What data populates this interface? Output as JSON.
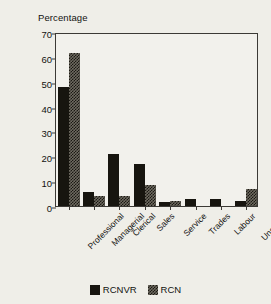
{
  "chart_data": {
    "type": "bar",
    "title": "",
    "ylabel": "Percentage",
    "xlabel": "",
    "ylim": [
      0,
      70
    ],
    "yticks": [
      0,
      10,
      20,
      30,
      40,
      50,
      60,
      70
    ],
    "grid": false,
    "legend_position": "bottom-center",
    "categories": [
      "Professional",
      "Managerial",
      "Clerical",
      "Sales",
      "Service",
      "Trades",
      "Labour",
      "Unskilled"
    ],
    "series": [
      {
        "name": "RCNVR",
        "color": "#17150f",
        "fill": "solid",
        "values": [
          48,
          5.5,
          21,
          17,
          1.5,
          3,
          3,
          2
        ]
      },
      {
        "name": "RCN",
        "color": "#6e6a60",
        "fill": "hatched",
        "values": [
          61.5,
          4,
          4,
          8.5,
          2,
          0,
          0,
          7
        ]
      }
    ]
  },
  "figure": {
    "background_color": "#efeee8",
    "axis_color": "#3c3a36",
    "text_color": "#121210"
  }
}
